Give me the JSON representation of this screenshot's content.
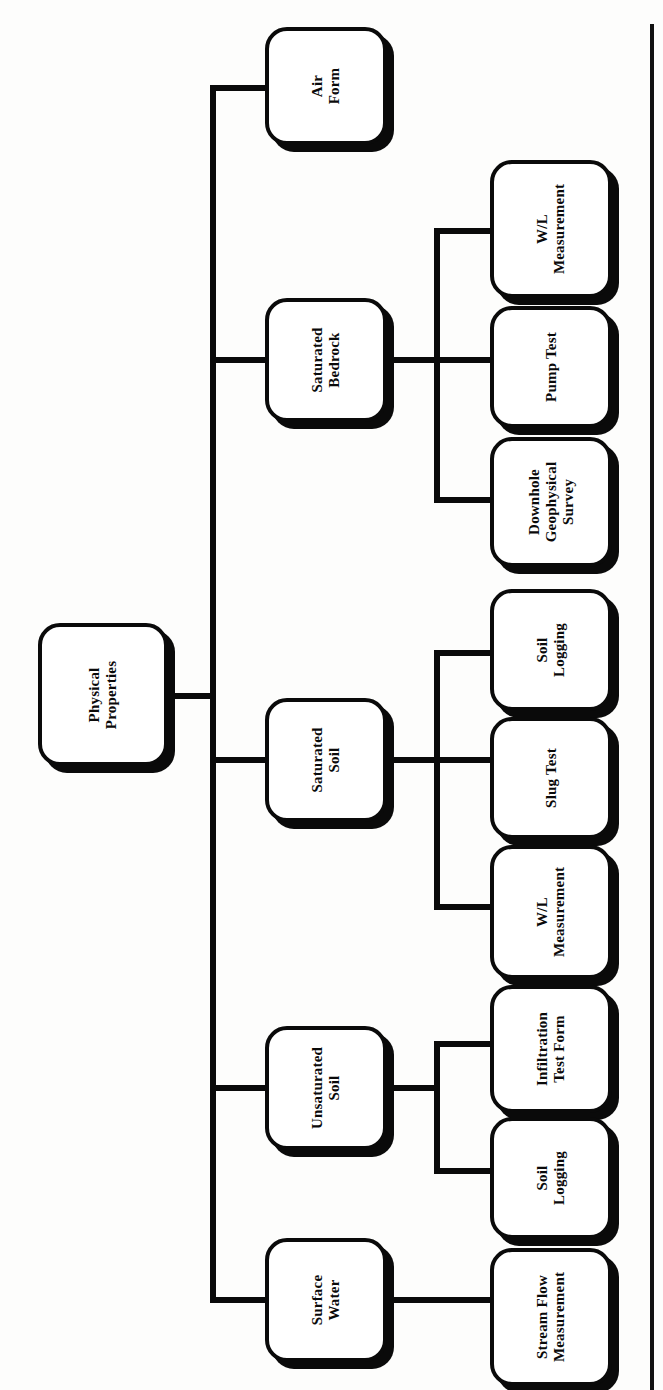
{
  "diagram": {
    "type": "hierarchy-tree",
    "orientation": "rotated-90-ccw",
    "title": "Physical Properties",
    "root": {
      "id": "physical-properties",
      "label": "Physical\nProperties"
    },
    "level2": [
      {
        "id": "air-form",
        "label": "Air\nForm"
      },
      {
        "id": "saturated-bedrock",
        "label": "Saturated\nBedrock"
      },
      {
        "id": "saturated-soil",
        "label": "Saturated\nSoil"
      },
      {
        "id": "unsaturated-soil",
        "label": "Unsaturated\nSoil"
      },
      {
        "id": "surface-water",
        "label": "Surface\nWater"
      }
    ],
    "level3": [
      {
        "id": "bedrock-wl-measurement",
        "parent": "saturated-bedrock",
        "label": "W/L\nMeasurement"
      },
      {
        "id": "bedrock-pump-test",
        "parent": "saturated-bedrock",
        "label": "Pump Test"
      },
      {
        "id": "bedrock-downhole-survey",
        "parent": "saturated-bedrock",
        "label": "Downhole\nGeophysical\nSurvey"
      },
      {
        "id": "satsoil-soil-logging",
        "parent": "saturated-soil",
        "label": "Soil\nLogging"
      },
      {
        "id": "satsoil-slug-test",
        "parent": "saturated-soil",
        "label": "Slug Test"
      },
      {
        "id": "satsoil-wl-measurement",
        "parent": "saturated-soil",
        "label": "W/L\nMeasurement"
      },
      {
        "id": "unsat-infiltration-test",
        "parent": "unsaturated-soil",
        "label": "Infiltration\nTest Form"
      },
      {
        "id": "unsat-soil-logging",
        "parent": "unsaturated-soil",
        "label": "Soil\nLogging"
      },
      {
        "id": "surfacewater-stream-flow",
        "parent": "surface-water",
        "label": "Stream Flow\nMeasurement"
      }
    ],
    "colors": {
      "ink": "#0a0a0a",
      "paper": "#fdfdfc",
      "node_fill": "#ffffff"
    }
  }
}
